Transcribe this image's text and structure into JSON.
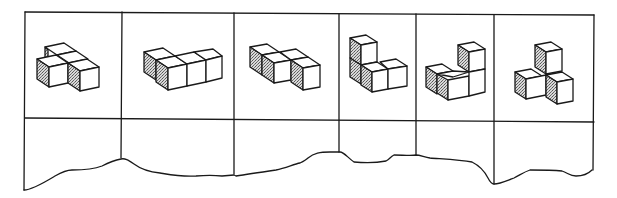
{
  "diagram": {
    "type": "isometric-cube-puzzle-strip",
    "layout": {
      "rows": 2,
      "columns": 6,
      "top_row": "cube figures",
      "bottom_row": "empty answer cells with torn bottom edge"
    },
    "colors": {
      "line": "#1a1a1a",
      "background": "#ffffff",
      "shaded_face": "#9a9a9a"
    },
    "cells": [
      {
        "index": 1,
        "cube_count": 4,
        "shape": "T-shaped block: two cubes back row, two cubes front staggered",
        "answer": ""
      },
      {
        "index": 2,
        "cube_count": 4,
        "shape": "L-shaped block: one cube behind, three cubes in front row",
        "answer": ""
      },
      {
        "index": 3,
        "cube_count": 4,
        "shape": "S/Z-shaped block: two cubes left, two cubes offset right",
        "answer": ""
      },
      {
        "index": 4,
        "cube_count": 4,
        "shape": "L-shaped upright: two stacked on left, two in bottom row to the right",
        "answer": ""
      },
      {
        "index": 5,
        "cube_count": 4,
        "shape": "Step block: two cubes bottom-left, column of two on the right",
        "answer": ""
      },
      {
        "index": 6,
        "cube_count": 4,
        "shape": "Pyramid: one cube on top, cubes at left and right base",
        "answer": ""
      }
    ]
  }
}
